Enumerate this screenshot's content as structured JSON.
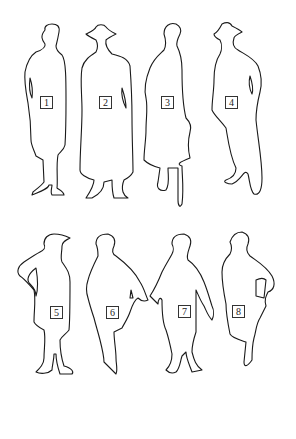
{
  "figure": {
    "background": "#ffffff",
    "stroke_color": "#1a1a1a",
    "silhouettes": [
      {
        "id": 1,
        "label": "1",
        "row": 1,
        "description": "woman in short-haired bob, coat, hand in pocket"
      },
      {
        "id": 2,
        "label": "2",
        "row": 1,
        "description": "figure in wide-brim hat and long coat"
      },
      {
        "id": 3,
        "label": "3",
        "row": 1,
        "description": "woman in cloche hat, flared coat, holding bag"
      },
      {
        "id": 4,
        "label": "4",
        "row": 1,
        "description": "figure in hat, jacket, hand in pocket"
      },
      {
        "id": 5,
        "label": "5",
        "row": 2,
        "description": "figure in cap, hand on hip"
      },
      {
        "id": 6,
        "label": "6",
        "row": 2,
        "description": "woman in cape, holding hands with figure 7"
      },
      {
        "id": 7,
        "label": "7",
        "row": 2,
        "description": "woman in dress with arms down"
      },
      {
        "id": 8,
        "label": "8",
        "row": 2,
        "description": "woman with hand on hip holding clutch"
      }
    ]
  }
}
